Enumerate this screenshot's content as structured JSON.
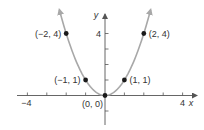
{
  "chart_data": {
    "type": "line",
    "title": "",
    "function": "y = x^2",
    "xlabel": "x",
    "ylabel": "y",
    "xlim": [
      -4,
      4.5
    ],
    "ylim": [
      -2,
      5
    ],
    "x_ticks": [
      -4,
      -3,
      -2,
      -1,
      1,
      2,
      3,
      4
    ],
    "x_tick_labels": [
      {
        "value": -4,
        "label": "−4"
      },
      {
        "value": 4,
        "label": "4"
      }
    ],
    "y_ticks": [
      -1,
      1,
      2,
      3,
      4
    ],
    "y_tick_labels": [
      {
        "value": 4,
        "label": "4"
      }
    ],
    "series": [
      {
        "name": "y = x^2",
        "curve_x_range": [
          -2.35,
          2.35
        ],
        "points": [
          {
            "x": -2,
            "y": 4,
            "label": "(−2, 4)"
          },
          {
            "x": -1,
            "y": 1,
            "label": "(−1, 1)"
          },
          {
            "x": 0,
            "y": 0,
            "label": "(0, 0)"
          },
          {
            "x": 1,
            "y": 1,
            "label": "(1, 1)"
          },
          {
            "x": 2,
            "y": 4,
            "label": "(2, 4)"
          }
        ]
      }
    ],
    "grid": false,
    "legend": null
  },
  "colors": {
    "curve": "#a8a8a8",
    "axis": "#555555",
    "point": "#1a1a1a",
    "text": "#333333"
  }
}
